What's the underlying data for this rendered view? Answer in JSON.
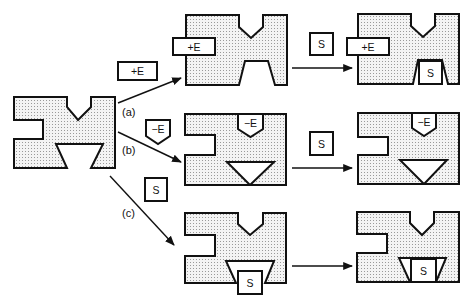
{
  "diagram": {
    "paths": [
      {
        "id": "a",
        "label": "(a)",
        "effector": "+E"
      },
      {
        "id": "b",
        "label": "(b)",
        "effector": "-E"
      },
      {
        "id": "c",
        "label": "(c)",
        "effector": "S"
      }
    ],
    "pieces": {
      "plus_e": "+E",
      "minus_e": "−E",
      "substrate": "S"
    },
    "colors": {
      "stroke": "#111111",
      "fill_dots": "#c8c8c8",
      "background": "#ffffff"
    }
  }
}
